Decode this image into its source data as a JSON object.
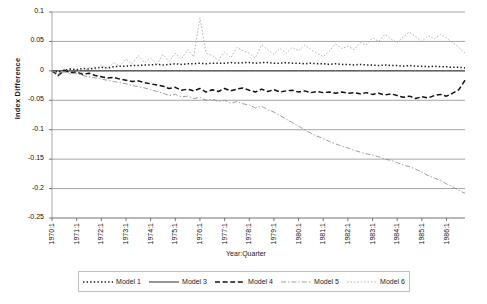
{
  "chart_data": {
    "type": "line",
    "title": "",
    "xlabel": "Year:Quarter",
    "ylabel": "Index Difference",
    "ylim": [
      -0.25,
      0.1
    ],
    "yticks": [
      0.1,
      0.05,
      0,
      -0.05,
      -0.1,
      -0.15,
      -0.2,
      -0.25
    ],
    "ytick_labels": [
      "0.1",
      "0.05",
      "0",
      "-0.05",
      "-0.1",
      "-0.15",
      "-0.2",
      "-0.25"
    ],
    "grid": true,
    "legend_position": "bottom",
    "xtick_labels": [
      "1970:1",
      "1971:1",
      "1972:1",
      "1973:1",
      "1974:1",
      "1975:1",
      "1976:1",
      "1977:1",
      "1978:1",
      "1979:1",
      "1980:1",
      "1981:1",
      "1982:1",
      "1983:1",
      "1984:1",
      "1985:1",
      "1986:1"
    ],
    "x_start": "1970:1",
    "x_end": "1986:4",
    "n_points": 68,
    "series": [
      {
        "name": "Model 1",
        "style": "dotted",
        "color": "#1a1a1a",
        "values": [
          0.0,
          -0.002,
          0.001,
          0.003,
          0.002,
          0.004,
          0.003,
          0.005,
          0.006,
          0.005,
          0.007,
          0.008,
          0.008,
          0.009,
          0.009,
          0.01,
          0.01,
          0.011,
          0.01,
          0.011,
          0.012,
          0.011,
          0.012,
          0.012,
          0.013,
          0.012,
          0.013,
          0.013,
          0.013,
          0.014,
          0.013,
          0.014,
          0.014,
          0.013,
          0.014,
          0.014,
          0.013,
          0.013,
          0.014,
          0.013,
          0.013,
          0.012,
          0.013,
          0.012,
          0.012,
          0.011,
          0.012,
          0.011,
          0.011,
          0.01,
          0.011,
          0.01,
          0.01,
          0.009,
          0.01,
          0.009,
          0.009,
          0.008,
          0.009,
          0.008,
          0.008,
          0.007,
          0.008,
          0.007,
          0.007,
          0.006,
          0.006,
          0.005
        ]
      },
      {
        "name": "Model 3",
        "style": "solid",
        "color": "#1a1a1a",
        "values": [
          0.0,
          0.0,
          0.0,
          0.0,
          0.0,
          0.0,
          0.0,
          0.0,
          0.0,
          0.0,
          0.0,
          0.0,
          0.0,
          0.0,
          0.0,
          0.0,
          0.0,
          0.0,
          0.0,
          0.0,
          0.0,
          0.0,
          0.0,
          0.0,
          0.0,
          0.0,
          0.0,
          0.0,
          0.0,
          0.0,
          0.0,
          0.0,
          0.0,
          0.0,
          0.0,
          0.0,
          0.0,
          0.0,
          0.0,
          0.0,
          0.0,
          0.0,
          0.0,
          0.0,
          0.0,
          0.0,
          0.0,
          0.0,
          0.0,
          0.0,
          0.0,
          0.0,
          0.0,
          0.0,
          0.0,
          0.0,
          0.0,
          0.0,
          0.0,
          0.0,
          0.0,
          0.0,
          0.0,
          0.0,
          0.0,
          0.0,
          0.0,
          0.0
        ]
      },
      {
        "name": "Model 4",
        "style": "dashed",
        "color": "#111111",
        "values": [
          0.0,
          -0.008,
          0.001,
          -0.003,
          -0.002,
          -0.006,
          -0.004,
          -0.008,
          -0.01,
          -0.012,
          -0.011,
          -0.014,
          -0.016,
          -0.018,
          -0.017,
          -0.02,
          -0.022,
          -0.024,
          -0.026,
          -0.03,
          -0.028,
          -0.033,
          -0.031,
          -0.034,
          -0.03,
          -0.036,
          -0.032,
          -0.035,
          -0.03,
          -0.034,
          -0.031,
          -0.029,
          -0.033,
          -0.036,
          -0.031,
          -0.035,
          -0.032,
          -0.036,
          -0.034,
          -0.033,
          -0.036,
          -0.034,
          -0.037,
          -0.035,
          -0.037,
          -0.036,
          -0.038,
          -0.036,
          -0.038,
          -0.037,
          -0.039,
          -0.037,
          -0.04,
          -0.038,
          -0.041,
          -0.039,
          -0.042,
          -0.045,
          -0.043,
          -0.047,
          -0.044,
          -0.046,
          -0.042,
          -0.04,
          -0.043,
          -0.038,
          -0.032,
          -0.016
        ]
      },
      {
        "name": "Model 5",
        "style": "dashdot",
        "color": "#8c8c8c",
        "values": [
          0.0,
          -0.004,
          -0.002,
          -0.005,
          -0.004,
          -0.008,
          -0.01,
          -0.012,
          -0.014,
          -0.016,
          -0.018,
          -0.02,
          -0.022,
          -0.025,
          -0.027,
          -0.029,
          -0.032,
          -0.035,
          -0.038,
          -0.042,
          -0.04,
          -0.044,
          -0.043,
          -0.047,
          -0.045,
          -0.05,
          -0.048,
          -0.052,
          -0.05,
          -0.055,
          -0.052,
          -0.056,
          -0.058,
          -0.063,
          -0.06,
          -0.066,
          -0.07,
          -0.076,
          -0.082,
          -0.088,
          -0.094,
          -0.1,
          -0.106,
          -0.111,
          -0.115,
          -0.12,
          -0.124,
          -0.128,
          -0.131,
          -0.135,
          -0.138,
          -0.141,
          -0.143,
          -0.146,
          -0.15,
          -0.152,
          -0.156,
          -0.16,
          -0.163,
          -0.167,
          -0.172,
          -0.178,
          -0.182,
          -0.186,
          -0.192,
          -0.197,
          -0.203,
          -0.208
        ]
      },
      {
        "name": "Model 6",
        "style": "dotted-light",
        "color": "#a6a6a6",
        "values": [
          0.0,
          -0.01,
          0.004,
          -0.006,
          0.003,
          -0.004,
          0.006,
          0.002,
          0.01,
          0.004,
          0.014,
          0.008,
          0.02,
          0.012,
          0.026,
          0.014,
          0.022,
          0.01,
          0.028,
          0.016,
          0.03,
          0.02,
          0.036,
          0.024,
          0.09,
          0.03,
          0.026,
          0.018,
          0.032,
          0.022,
          0.04,
          0.034,
          0.03,
          0.022,
          0.044,
          0.036,
          0.028,
          0.038,
          0.03,
          0.04,
          0.034,
          0.044,
          0.036,
          0.03,
          0.024,
          0.034,
          0.046,
          0.038,
          0.042,
          0.036,
          0.048,
          0.044,
          0.056,
          0.05,
          0.062,
          0.054,
          0.048,
          0.058,
          0.066,
          0.058,
          0.05,
          0.06,
          0.054,
          0.062,
          0.056,
          0.048,
          0.04,
          0.03
        ]
      }
    ]
  },
  "legend": {
    "items": [
      {
        "label": "Model 1"
      },
      {
        "label": "Model 3"
      },
      {
        "label": "Model 4"
      },
      {
        "label": "Model 5"
      },
      {
        "label": "Model 6"
      }
    ]
  }
}
